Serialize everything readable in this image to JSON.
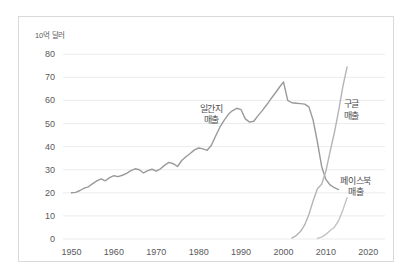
{
  "chart_data": {
    "type": "line",
    "title": "",
    "subtitle": "",
    "xlabel": "",
    "ylabel": "10억 달러",
    "unit_label": "10억 달러",
    "xlim": [
      1948,
      2023
    ],
    "ylim": [
      0,
      84
    ],
    "xticks": [
      "1950",
      "1960",
      "1970",
      "1980",
      "1990",
      "2000",
      "2010",
      "2020"
    ],
    "xtick_values": [
      1950,
      1960,
      1970,
      1980,
      1990,
      2000,
      2010,
      2020
    ],
    "yticks": [
      "0",
      "10",
      "20",
      "30",
      "40",
      "50",
      "60",
      "70",
      "80"
    ],
    "ytick_values": [
      0,
      10,
      20,
      30,
      40,
      50,
      60,
      70,
      80
    ],
    "grid": "horizontal",
    "legend_position": "inline-annotations",
    "series": [
      {
        "name": "일간지 매출",
        "label": "일간지\n매출",
        "label_line1": "일간지",
        "label_line2": "매출",
        "color": "#9a9a9a",
        "x": [
          1950,
          1951,
          1952,
          1953,
          1954,
          1955,
          1956,
          1957,
          1958,
          1959,
          1960,
          1961,
          1962,
          1963,
          1964,
          1965,
          1966,
          1967,
          1968,
          1969,
          1970,
          1971,
          1972,
          1973,
          1974,
          1975,
          1976,
          1977,
          1978,
          1979,
          1980,
          1981,
          1982,
          1983,
          1984,
          1985,
          1986,
          1987,
          1988,
          1989,
          1990,
          1991,
          1992,
          1993,
          1994,
          1995,
          1996,
          1997,
          1998,
          1999,
          2000,
          2001,
          2002,
          2003,
          2004,
          2005,
          2006,
          2007,
          2008,
          2009,
          2010,
          2011,
          2012,
          2013
        ],
        "values": [
          20.0,
          20.2,
          21.0,
          22.0,
          22.6,
          24.0,
          25.2,
          26.0,
          25.2,
          26.6,
          27.4,
          27.0,
          27.6,
          28.4,
          29.6,
          30.4,
          30.0,
          28.6,
          29.6,
          30.2,
          29.4,
          30.4,
          32.0,
          33.2,
          32.6,
          31.4,
          34.0,
          35.6,
          37.0,
          38.6,
          39.4,
          39.0,
          38.4,
          40.6,
          44.6,
          48.4,
          51.4,
          54.0,
          55.6,
          56.6,
          56.0,
          52.0,
          50.6,
          51.0,
          53.4,
          55.6,
          58.0,
          60.6,
          63.0,
          65.6,
          68.0,
          60.0,
          59.0,
          58.8,
          58.6,
          58.4,
          57.2,
          51.4,
          42.0,
          31.4,
          25.8,
          23.4,
          22.2,
          21.4
        ]
      },
      {
        "name": "구글 매출",
        "label": "구글\n매출",
        "label_line1": "구글",
        "label_line2": "매출",
        "color": "#b4b4b4",
        "x": [
          2002,
          2003,
          2004,
          2005,
          2006,
          2007,
          2008,
          2009,
          2010,
          2011,
          2012,
          2013,
          2014,
          2015
        ],
        "values": [
          0.4,
          1.5,
          3.2,
          6.1,
          10.6,
          16.6,
          21.8,
          23.7,
          29.3,
          37.9,
          46.0,
          55.5,
          66.0,
          74.5
        ]
      },
      {
        "name": "페이스북 매출",
        "label": "페이스북\n매출",
        "label_line1": "페이스북",
        "label_line2": "매출",
        "color": "#c4c4c4",
        "x": [
          2008,
          2009,
          2010,
          2011,
          2012,
          2013,
          2014,
          2015
        ],
        "values": [
          0.3,
          0.8,
          2.0,
          3.7,
          5.1,
          7.9,
          12.5,
          17.9
        ]
      }
    ],
    "annotations": [
      {
        "text": "일간지 매출",
        "x": 1983,
        "y": 55
      },
      {
        "text": "구글 매출",
        "x": 2016,
        "y": 57
      },
      {
        "text": "페이스북 매출",
        "x": 2017,
        "y": 24
      }
    ]
  }
}
